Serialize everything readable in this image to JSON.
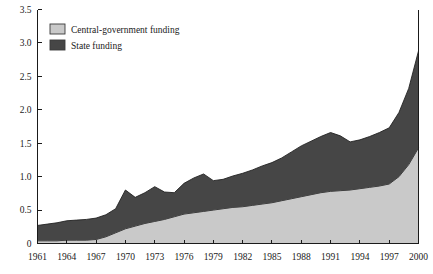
{
  "chart_data": {
    "type": "area",
    "stacked": true,
    "title": "",
    "subtitle": "",
    "xlabel": "",
    "ylabel": "",
    "xlim": [
      1961,
      2000
    ],
    "ylim": [
      0,
      3.5
    ],
    "ytick_values": [
      0,
      0.5,
      1.0,
      1.5,
      2.0,
      2.5,
      3.0,
      3.5
    ],
    "ytick_labels": [
      "0",
      "0.5",
      "1.0",
      "1.5",
      "2.0",
      "2.5",
      "3.0",
      "3.5"
    ],
    "xtick_values": [
      1961,
      1964,
      1967,
      1970,
      1973,
      1976,
      1979,
      1982,
      1985,
      1988,
      1991,
      1994,
      1997,
      2000
    ],
    "xtick_labels": [
      "1961",
      "1964",
      "1967",
      "1970",
      "1973",
      "1976",
      "1979",
      "1982",
      "1985",
      "1988",
      "1991",
      "1994",
      "1997",
      "2000"
    ],
    "grid": false,
    "legend_position": "top-left",
    "x": [
      1961,
      1962,
      1963,
      1964,
      1965,
      1966,
      1967,
      1968,
      1969,
      1970,
      1971,
      1972,
      1973,
      1974,
      1975,
      1976,
      1977,
      1978,
      1979,
      1980,
      1981,
      1982,
      1983,
      1984,
      1985,
      1986,
      1987,
      1988,
      1989,
      1990,
      1991,
      1992,
      1993,
      1994,
      1995,
      1996,
      1997,
      1998,
      1999,
      2000
    ],
    "series": [
      {
        "name": "Central-government funding",
        "color": "#c9c9c9",
        "values": [
          0.04,
          0.04,
          0.04,
          0.05,
          0.05,
          0.05,
          0.06,
          0.1,
          0.16,
          0.22,
          0.26,
          0.3,
          0.33,
          0.36,
          0.4,
          0.44,
          0.46,
          0.48,
          0.5,
          0.52,
          0.54,
          0.55,
          0.57,
          0.59,
          0.61,
          0.64,
          0.67,
          0.7,
          0.73,
          0.76,
          0.78,
          0.79,
          0.8,
          0.82,
          0.84,
          0.86,
          0.89,
          1.0,
          1.18,
          1.43
        ]
      },
      {
        "name": "State funding",
        "color": "#464646",
        "values": [
          0.23,
          0.25,
          0.27,
          0.29,
          0.3,
          0.31,
          0.32,
          0.33,
          0.36,
          0.58,
          0.43,
          0.46,
          0.52,
          0.41,
          0.36,
          0.46,
          0.52,
          0.56,
          0.44,
          0.44,
          0.47,
          0.5,
          0.53,
          0.57,
          0.6,
          0.64,
          0.7,
          0.76,
          0.8,
          0.84,
          0.88,
          0.82,
          0.72,
          0.73,
          0.76,
          0.8,
          0.84,
          0.96,
          1.14,
          1.45
        ]
      }
    ],
    "totals": [
      0.27,
      0.29,
      0.31,
      0.34,
      0.35,
      0.36,
      0.38,
      0.43,
      0.52,
      0.8,
      0.69,
      0.76,
      0.85,
      0.77,
      0.76,
      0.9,
      0.98,
      1.04,
      0.94,
      0.96,
      1.01,
      1.05,
      1.1,
      1.16,
      1.21,
      1.28,
      1.37,
      1.46,
      1.53,
      1.6,
      1.66,
      1.61,
      1.52,
      1.55,
      1.6,
      1.66,
      1.73,
      1.96,
      2.32,
      2.88
    ]
  },
  "legend": {
    "items": [
      {
        "label": "Central-government funding",
        "color": "#c9c9c9"
      },
      {
        "label": "State funding",
        "color": "#464646"
      }
    ]
  }
}
